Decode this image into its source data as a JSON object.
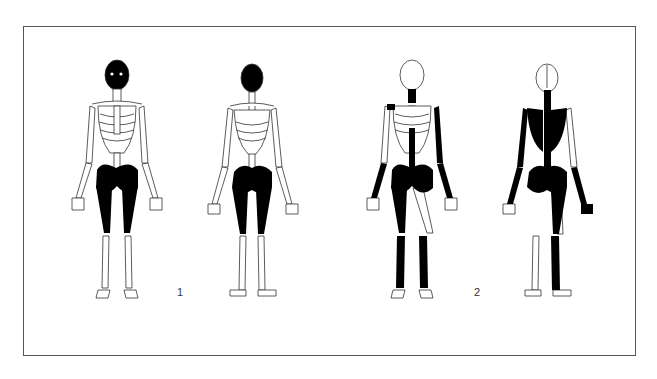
{
  "figure": {
    "panels": [
      {
        "id": 1,
        "label": "1",
        "views": [
          "anterior",
          "posterior"
        ],
        "shaded": [
          "skull",
          "pelvis",
          "femora"
        ]
      },
      {
        "id": 2,
        "label": "2",
        "views": [
          "anterior",
          "posterior"
        ],
        "shaded": [
          "cervical-spine",
          "thoracic-vertebrae",
          "lumbar-vertebrae",
          "pelvis",
          "right-femur",
          "left-humerus-partial",
          "forearms",
          "tibiae",
          "fibulae",
          "scapulae"
        ]
      }
    ],
    "colors": {
      "fill": "#000000",
      "outline": "#333333",
      "background": "#ffffff",
      "frame": "#555555"
    }
  }
}
